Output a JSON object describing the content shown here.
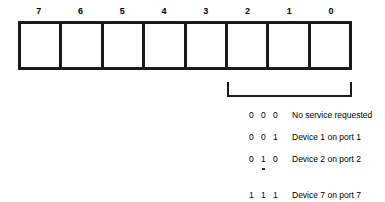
{
  "figure": {
    "name": "service-request-byte-format",
    "bit_field": {
      "label_row_name": "bit-number-labels",
      "bit_labels": [
        "7",
        "6",
        "5",
        "4",
        "3",
        "2",
        "1",
        "0"
      ],
      "cell_count": 8,
      "cell_values": [
        "",
        "",
        "",
        "",
        "",
        "",
        "",
        ""
      ]
    },
    "bracket": {
      "name": "low-three-bits-bracket",
      "spans_bits": [
        "2",
        "1",
        "0"
      ]
    },
    "legend": {
      "name": "encoding-legend",
      "rows": [
        {
          "bits": [
            "0",
            "0",
            "0"
          ],
          "description": "No service requested"
        },
        {
          "bits": [
            "0",
            "0",
            "1"
          ],
          "description": "Device 1 on port 1"
        },
        {
          "bits": [
            "0",
            "1",
            "0"
          ],
          "description": "Device 2 on port 2"
        },
        {
          "bits": [
            "1",
            "1",
            "1"
          ],
          "description": "Device 7 on port 7"
        }
      ],
      "continuation_marker": "vertical-ellipsis"
    },
    "colors": {
      "ink": "#1a1a1a",
      "paper": "#ffffff"
    }
  }
}
